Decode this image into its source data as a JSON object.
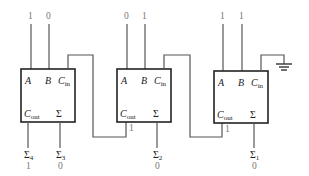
{
  "diagram": {
    "type": "ripple-carry-adder",
    "colors": {
      "wire": "#555555",
      "box_border": "#222222",
      "value_text": "#777777",
      "label_text": "#222222"
    },
    "port_labels": {
      "a": "A",
      "b": "B",
      "cin_main": "C",
      "cin_sub": "in",
      "cout_main": "C",
      "cout_sub": "out",
      "sum": "Σ"
    },
    "adders": [
      {
        "id": "adder-4",
        "inputs": {
          "a": "1",
          "b": "0"
        },
        "cout_value": "",
        "sum_label": "Σ",
        "sum_index": "4",
        "sum_value": "1",
        "carry_out_label": "Σ",
        "carry_out_index": "4"
      },
      {
        "id": "adder-3",
        "inputs": {
          "a": "",
          "b": ""
        },
        "cout_value": "",
        "sum_label": "Σ",
        "sum_index": "3",
        "sum_value": "0"
      },
      {
        "id": "adder-2",
        "inputs": {
          "a": "0",
          "b": "1"
        },
        "cout_value": "1",
        "sum_label": "Σ",
        "sum_index": "2",
        "sum_value": "0"
      },
      {
        "id": "adder-1",
        "inputs": {
          "a": "1",
          "b": "1"
        },
        "cout_value": "1",
        "sum_label": "Σ",
        "sum_index": "1",
        "sum_value": "0"
      }
    ],
    "ground": "ground-symbol"
  },
  "labels": {
    "top": {
      "a1": "1",
      "b1": "0",
      "a2": "0",
      "b2": "1",
      "a3": "1",
      "b3": "1"
    },
    "bottom": {
      "s4": "Σ",
      "s4i": "4",
      "s4v": "1",
      "s3": "Σ",
      "s3i": "3",
      "s3v": "0",
      "s2": "Σ",
      "s2i": "2",
      "s2v": "0",
      "s1": "Σ",
      "s1i": "1",
      "s1v": "0"
    },
    "carry": {
      "c2": "1",
      "c3": "1"
    }
  }
}
